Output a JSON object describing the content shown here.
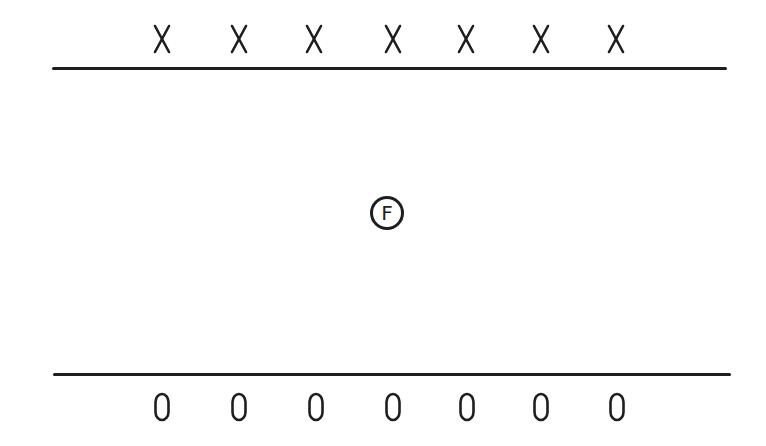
{
  "diagram": {
    "colors": {
      "ink": "#1e1e1e",
      "background": "#ffffff"
    },
    "top_row": {
      "symbol": "X",
      "count": 7,
      "positions_x": [
        162,
        239,
        314,
        393,
        466,
        541,
        616
      ],
      "y": 39
    },
    "top_line": {
      "x1": 52,
      "x2": 727,
      "y": 68
    },
    "center_marker": {
      "label": "F",
      "x": 387,
      "y": 213
    },
    "bottom_line": {
      "x1": 53,
      "x2": 731,
      "y": 374
    },
    "bottom_row": {
      "symbol": "0",
      "count": 7,
      "positions_x": [
        162,
        239,
        316,
        393,
        467,
        541,
        617
      ],
      "y": 407
    }
  }
}
